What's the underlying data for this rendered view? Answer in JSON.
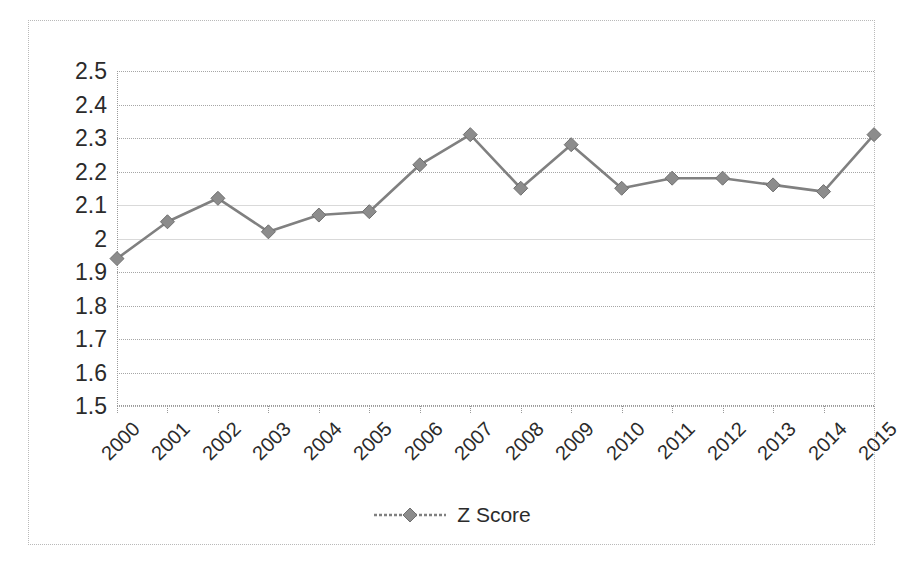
{
  "chart_data": {
    "type": "line",
    "title": "",
    "xlabel": "",
    "ylabel": "",
    "categories": [
      "2000",
      "2001",
      "2002",
      "2003",
      "2004",
      "2005",
      "2006",
      "2007",
      "2008",
      "2009",
      "2010",
      "2011",
      "2012",
      "2013",
      "2014",
      "2015"
    ],
    "series": [
      {
        "name": "Z Score",
        "values": [
          1.94,
          2.05,
          2.12,
          2.02,
          2.07,
          2.08,
          2.22,
          2.31,
          2.15,
          2.28,
          2.15,
          2.18,
          2.18,
          2.16,
          2.14,
          2.31
        ],
        "color": "#808080",
        "marker": "diamond"
      }
    ],
    "ylim": [
      1.5,
      2.5
    ],
    "ytick_labels": [
      "2.5",
      "2.4",
      "2.3",
      "2.2",
      "2.1",
      "2",
      "1.9",
      "1.8",
      "1.7",
      "1.6",
      "1.5"
    ],
    "ytick_values": [
      2.5,
      2.4,
      2.3,
      2.2,
      2.1,
      2.0,
      1.9,
      1.8,
      1.7,
      1.6,
      1.5
    ],
    "grid": true,
    "legend_position": "bottom"
  },
  "legend": {
    "entries": [
      {
        "label": "Z Score",
        "color": "#808080"
      }
    ]
  },
  "colors": {
    "series_line": "#808080",
    "marker_fill": "#8c8c8c",
    "gridline": "#a6a6a6",
    "axis": "#9a9a9a",
    "frame_border": "#b9b9b9",
    "text": "#2b2b2b",
    "background": "#ffffff"
  }
}
